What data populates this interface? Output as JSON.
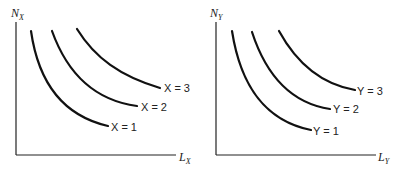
{
  "panels": [
    {
      "id": "x",
      "y_axis": {
        "label": "N",
        "subscript": "X"
      },
      "x_axis": {
        "label": "L",
        "subscript": "X"
      },
      "curves": [
        {
          "var": "X",
          "value": "1",
          "label": "X = 1"
        },
        {
          "var": "X",
          "value": "2",
          "label": "X = 2"
        },
        {
          "var": "X",
          "value": "3",
          "label": "X = 3"
        }
      ]
    },
    {
      "id": "y",
      "y_axis": {
        "label": "N",
        "subscript": "Y"
      },
      "x_axis": {
        "label": "L",
        "subscript": "Y"
      },
      "curves": [
        {
          "var": "Y",
          "value": "1",
          "label": "Y = 1"
        },
        {
          "var": "Y",
          "value": "2",
          "label": "Y = 2"
        },
        {
          "var": "Y",
          "value": "3",
          "label": "Y = 3"
        }
      ]
    }
  ],
  "colors": {
    "line": "#111111",
    "background": "#ffffff"
  }
}
